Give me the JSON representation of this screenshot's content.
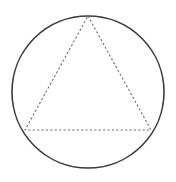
{
  "figure": {
    "background_color": "#ffffff",
    "width": 176,
    "height": 182
  },
  "chart_data": {
    "type": "diagram",
    "subtitle": "",
    "xlabel": "",
    "ylabel": "",
    "grid": false,
    "legend": false,
    "annotations": [],
    "tick_labels": [],
    "shapes": [
      {
        "name": "circumscribed-circle",
        "kind": "circle",
        "cx": 88,
        "cy": 92,
        "r": 76,
        "stroke": "#3a3a3a",
        "stroke_width": 1.6,
        "stroke_style": "solid",
        "fill": "none"
      },
      {
        "name": "inscribed-triangle",
        "kind": "polygon",
        "points": "88,16 151,130 25,130",
        "vertices": [
          {
            "label": "apex-top",
            "x": 88,
            "y": 16
          },
          {
            "label": "bottom-right",
            "x": 151,
            "y": 130
          },
          {
            "label": "bottom-left",
            "x": 25,
            "y": 130
          }
        ],
        "stroke": "#6e6e6e",
        "stroke_width": 1.1,
        "stroke_style": "dashed",
        "dash_array": "2.2 2.2",
        "fill": "none"
      }
    ]
  }
}
